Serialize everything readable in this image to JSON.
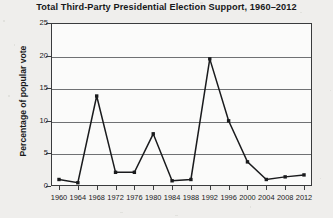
{
  "chart_data": {
    "type": "line",
    "title": "Total Third-Party Presidential Election Support, 1960–2012",
    "xlabel": "",
    "ylabel": "Percentage of popular vote",
    "categories": [
      "1960",
      "1964",
      "1968",
      "1972",
      "1976",
      "1980",
      "1984",
      "1988",
      "1992",
      "1996",
      "2000",
      "2004",
      "2008",
      "2012"
    ],
    "values": [
      1.0,
      0.5,
      13.8,
      2.1,
      2.1,
      8.0,
      0.8,
      1.0,
      19.5,
      10.0,
      3.7,
      1.0,
      1.4,
      1.7
    ],
    "ylim": [
      0,
      25
    ],
    "yticks": [
      0,
      5,
      10,
      15,
      20,
      25
    ],
    "ytick_labels": [
      "0",
      "5",
      "10",
      "15",
      "20",
      "25"
    ],
    "grid": true,
    "legend": false,
    "marker": "square",
    "line_color": "#1a1b1d",
    "grid_color": "#6f7173",
    "plot_bg": "#fbfbfa",
    "figure_bg": "#efeeec"
  }
}
